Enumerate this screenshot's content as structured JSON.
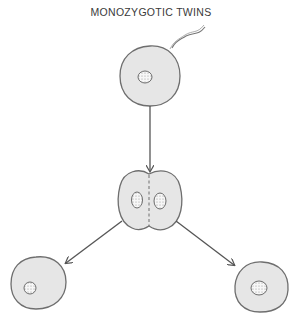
{
  "title": "MONOZYGOTIC TWINS",
  "diagram": {
    "nodes": [
      {
        "id": "zygote",
        "label": "fertilized egg with sperm"
      },
      {
        "id": "two-cell",
        "label": "two-cell stage splitting"
      },
      {
        "id": "twin-left",
        "label": "twin embryo cell (left)"
      },
      {
        "id": "twin-right",
        "label": "twin embryo cell (right)"
      }
    ],
    "edges": [
      {
        "from": "zygote",
        "to": "two-cell"
      },
      {
        "from": "two-cell",
        "to": "twin-left"
      },
      {
        "from": "two-cell",
        "to": "twin-right"
      }
    ],
    "colors": {
      "cell_fill": "#e6e6e6",
      "cell_stroke": "#6e6e6e",
      "arrow": "#555555",
      "nucleus_fill": "#f7f7f7"
    }
  }
}
